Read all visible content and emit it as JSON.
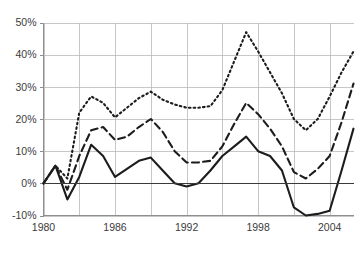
{
  "chart_data": {
    "type": "line",
    "title": "",
    "subtitle": "",
    "xlabel": "",
    "ylabel": "",
    "xlim": [
      1980,
      2006
    ],
    "ylim": [
      -0.1,
      0.5
    ],
    "grid": true,
    "legend_position": "none",
    "x_tick_labels": [
      "1980",
      "1986",
      "1992",
      "1998",
      "2004"
    ],
    "x_tick_values": [
      1980,
      1986,
      1992,
      1998,
      2004
    ],
    "x_gridline_values": [
      1980,
      1983,
      1986,
      1989,
      1992,
      1995,
      1998,
      2001,
      2004
    ],
    "y_tick_labels": [
      "-10%",
      "0%",
      "10%",
      "20%",
      "30%",
      "40%",
      "50%"
    ],
    "y_tick_values": [
      -0.1,
      0.0,
      0.1,
      0.2,
      0.3,
      0.4,
      0.5
    ],
    "x": [
      1980,
      1981,
      1982,
      1983,
      1984,
      1985,
      1986,
      1987,
      1988,
      1989,
      1990,
      1991,
      1992,
      1993,
      1994,
      1995,
      1996,
      1997,
      1998,
      1999,
      2000,
      2001,
      2002,
      2003,
      2004,
      2005,
      2006
    ],
    "series": [
      {
        "name": "top-series",
        "style": "dotted",
        "color": "#1c1c1c",
        "values": [
          0.0,
          0.055,
          0.015,
          0.22,
          0.27,
          0.25,
          0.205,
          0.235,
          0.265,
          0.285,
          0.26,
          0.245,
          0.235,
          0.235,
          0.24,
          0.29,
          0.38,
          0.47,
          0.41,
          0.345,
          0.28,
          0.2,
          0.165,
          0.2,
          0.27,
          0.345,
          0.41
        ]
      },
      {
        "name": "middle-series",
        "style": "dashed",
        "color": "#1c1c1c",
        "values": [
          0.0,
          0.055,
          -0.02,
          0.085,
          0.165,
          0.175,
          0.135,
          0.145,
          0.175,
          0.2,
          0.16,
          0.1,
          0.065,
          0.065,
          0.07,
          0.115,
          0.185,
          0.25,
          0.215,
          0.17,
          0.115,
          0.035,
          0.015,
          0.045,
          0.085,
          0.19,
          0.31
        ]
      },
      {
        "name": "bottom-series",
        "style": "solid",
        "color": "#1c1c1c",
        "values": [
          0.0,
          0.055,
          -0.05,
          0.02,
          0.12,
          0.085,
          0.02,
          0.045,
          0.07,
          0.08,
          0.04,
          0.0,
          -0.01,
          0.0,
          0.04,
          0.085,
          0.115,
          0.145,
          0.1,
          0.085,
          0.04,
          -0.075,
          -0.1,
          -0.095,
          -0.085,
          0.04,
          0.17
        ]
      }
    ]
  }
}
